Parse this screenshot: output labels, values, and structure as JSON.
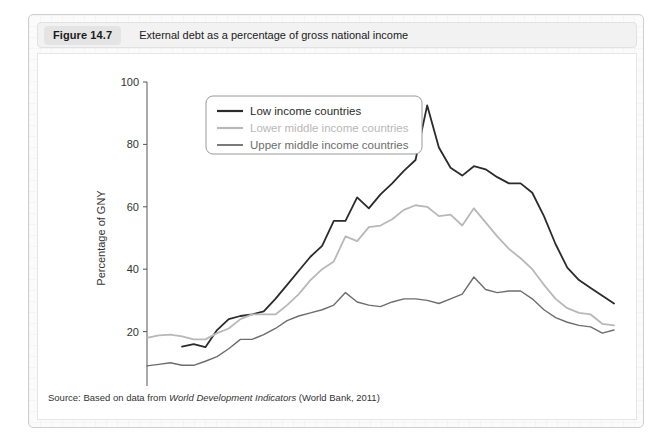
{
  "figure": {
    "number_label": "Figure 14.7",
    "caption": "External debt as a percentage of gross national income",
    "source_prefix": "Source: Based on data from ",
    "source_italic": "World Development Indicators",
    "source_suffix": " (World Bank, 2011)"
  },
  "chart_data": {
    "type": "line",
    "title": "External debt as a percentage of gross national income",
    "xlabel": "",
    "ylabel": "Percentage of GNY",
    "xlim": [
      1970,
      2010
    ],
    "ylim": [
      0,
      100
    ],
    "yticks": [
      0,
      20,
      40,
      60,
      80,
      100
    ],
    "xticks": [
      1970,
      1975,
      1980,
      1985,
      1990,
      1995,
      2000,
      2005,
      2010
    ],
    "x_minor_tick_step": 1,
    "grid": false,
    "legend_position": "top-left",
    "series": [
      {
        "name": "Low income countries",
        "color": "#2b2b2b",
        "width": 1.8,
        "x": [
          1973,
          1974,
          1975,
          1976,
          1977,
          1978,
          1979,
          1980,
          1981,
          1982,
          1983,
          1984,
          1985,
          1986,
          1987,
          1988,
          1989,
          1990,
          1991,
          1992,
          1993,
          1994,
          1995,
          1996,
          1997,
          1998,
          1999,
          2000,
          2001,
          2002,
          2003,
          2004,
          2005,
          2006,
          2007,
          2008,
          2009,
          2010
        ],
        "values": [
          15.2,
          16.0,
          15.0,
          20.5,
          24.0,
          25.0,
          25.5,
          26.5,
          30.5,
          35.0,
          39.5,
          44.0,
          47.5,
          55.5,
          55.5,
          63.0,
          59.5,
          64.0,
          67.5,
          71.5,
          75.0,
          92.5,
          79.0,
          72.5,
          70.0,
          73.0,
          72.0,
          69.5,
          67.5,
          67.5,
          64.5,
          57.0,
          48.0,
          40.5,
          36.5,
          34.0,
          31.5,
          29.0
        ]
      },
      {
        "name": "Lower middle income countries",
        "color": "#b8b8b8",
        "width": 1.8,
        "x": [
          1970,
          1971,
          1972,
          1973,
          1974,
          1975,
          1976,
          1977,
          1978,
          1979,
          1980,
          1981,
          1982,
          1983,
          1984,
          1985,
          1986,
          1987,
          1988,
          1989,
          1990,
          1991,
          1992,
          1993,
          1994,
          1995,
          1996,
          1997,
          1998,
          1999,
          2000,
          2001,
          2002,
          2003,
          2004,
          2005,
          2006,
          2007,
          2008,
          2009,
          2010
        ],
        "values": [
          18.0,
          18.8,
          19.0,
          18.5,
          17.5,
          17.5,
          19.5,
          21.0,
          24.0,
          25.5,
          25.5,
          25.5,
          28.5,
          32.0,
          36.5,
          40.0,
          42.5,
          50.5,
          49.0,
          53.5,
          54.0,
          56.0,
          59.0,
          60.5,
          60.0,
          57.0,
          57.5,
          54.0,
          59.5,
          55.0,
          50.5,
          46.5,
          43.5,
          40.0,
          35.0,
          30.5,
          27.5,
          26.0,
          25.5,
          22.5,
          22.0
        ]
      },
      {
        "name": "Upper middle income countries",
        "color": "#6d6d6d",
        "width": 1.4,
        "x": [
          1970,
          1971,
          1972,
          1973,
          1974,
          1975,
          1976,
          1977,
          1978,
          1979,
          1980,
          1981,
          1982,
          1983,
          1984,
          1985,
          1986,
          1987,
          1988,
          1989,
          1990,
          1991,
          1992,
          1993,
          1994,
          1995,
          1996,
          1997,
          1998,
          1999,
          2000,
          2001,
          2002,
          2003,
          2004,
          2005,
          2006,
          2007,
          2008,
          2009,
          2010
        ],
        "values": [
          9.0,
          9.5,
          10.0,
          9.2,
          9.2,
          10.5,
          12.0,
          14.5,
          17.5,
          17.5,
          19.0,
          21.0,
          23.5,
          25.0,
          26.0,
          27.0,
          28.5,
          32.5,
          29.5,
          28.5,
          28.0,
          29.5,
          30.5,
          30.5,
          30.0,
          29.0,
          30.5,
          32.0,
          37.5,
          33.5,
          32.5,
          33.0,
          33.0,
          30.5,
          27.0,
          24.5,
          23.0,
          22.0,
          21.5,
          19.5,
          20.5
        ]
      }
    ]
  }
}
